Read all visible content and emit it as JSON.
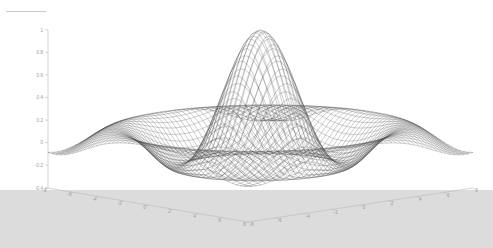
{
  "figure": {
    "title": "",
    "background_color": "#ffffff",
    "ground_color": "#dcdcdc",
    "mesh_color": "#4a4a4a",
    "axis_color": "#b8b8b8",
    "tick_label_color": "#9a9a9a"
  },
  "chart_data": {
    "type": "surface",
    "title": "",
    "subtitle": "",
    "xlabel": "",
    "ylabel": "",
    "zlabel": "",
    "function": "sin(r)/r  (sombrero / sinc surface)",
    "grid": false,
    "legend": "none",
    "projection": "3d-mesh-wireframe",
    "shading": "grayscale wireframe",
    "x": {
      "ticks": [
        -8,
        -6,
        -4,
        -2,
        0,
        2,
        4,
        6,
        8
      ],
      "tick_labels": [
        "-8",
        "-6",
        "-4",
        "-2",
        "0",
        "2",
        "4",
        "6",
        "8"
      ],
      "range": [
        -8,
        8
      ]
    },
    "y": {
      "ticks": [
        -8,
        -6,
        -4,
        -2,
        0,
        2,
        4,
        6,
        8
      ],
      "tick_labels": [
        "-8",
        "-6",
        "-4",
        "-2",
        "0",
        "2",
        "4",
        "6",
        "8"
      ],
      "range": [
        -8,
        8
      ]
    },
    "z": {
      "ticks": [
        -0.4,
        -0.2,
        0,
        0.2,
        0.4,
        0.6,
        0.8,
        1
      ],
      "tick_labels": [
        "-0.4",
        "-0.2",
        "0",
        "0.2",
        "0.4",
        "0.6",
        "0.8",
        "1"
      ],
      "range": [
        -0.4,
        1
      ]
    },
    "peak_value": 1,
    "min_value": -0.22,
    "grid_resolution": "50 x 50",
    "view": {
      "azimuth": -37.5,
      "elevation": 22
    }
  }
}
